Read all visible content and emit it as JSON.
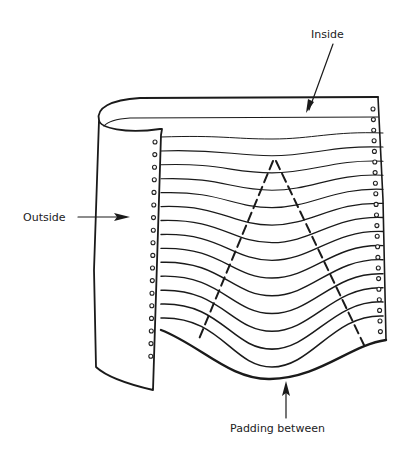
{
  "diagram": {
    "labels": {
      "inside": "Inside",
      "outside": "Outside",
      "padding": "Padding between"
    },
    "sheet_count": 14,
    "colors": {
      "ink": "#1a1a1a",
      "background": "#ffffff"
    }
  }
}
